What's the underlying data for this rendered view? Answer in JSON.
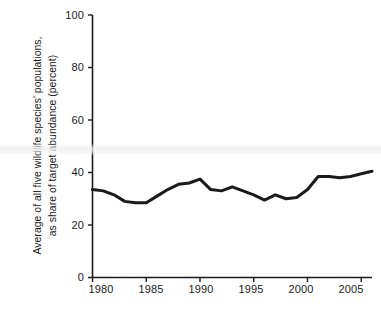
{
  "chart_data": {
    "type": "line",
    "title": "",
    "xlabel": "",
    "ylabel_line1": "Average of all five wildlife species' populations,",
    "ylabel_line2": "as share of target abundance (percent)",
    "xlim": [
      1980,
      2006
    ],
    "ylim": [
      0,
      100
    ],
    "grid": false,
    "legend": "none",
    "xticks": [
      "1980",
      "1985",
      "1990",
      "1995",
      "2000",
      "2005"
    ],
    "xtick_values": [
      1980,
      1985,
      1990,
      1995,
      2000,
      2005
    ],
    "yticks": [
      "0",
      "20",
      "40",
      "60",
      "80",
      "100"
    ],
    "ytick_values": [
      0,
      20,
      40,
      60,
      80,
      100
    ],
    "series": [
      {
        "name": "Average of all five wildlife species' populations",
        "color": "#1a1a1a",
        "line_width": 3,
        "x": [
          1980,
          1981,
          1982,
          1983,
          1984,
          1985,
          1986,
          1987,
          1988,
          1989,
          1990,
          1991,
          1992,
          1993,
          1994,
          1995,
          1996,
          1997,
          1998,
          1999,
          2000,
          2001,
          2002,
          2003,
          2004,
          2005,
          2006
        ],
        "values": [
          33.5,
          33,
          31.5,
          29,
          28.5,
          28.5,
          31,
          33.5,
          35.5,
          36,
          37.5,
          33.5,
          33,
          34.5,
          33,
          31.5,
          29.5,
          31.5,
          30,
          30.5,
          33.5,
          38.5,
          38.5,
          38,
          38.5,
          39.5,
          40.5
        ]
      }
    ]
  },
  "axes": {
    "y_axis_name": "y-axis",
    "x_axis_name": "x-axis"
  }
}
